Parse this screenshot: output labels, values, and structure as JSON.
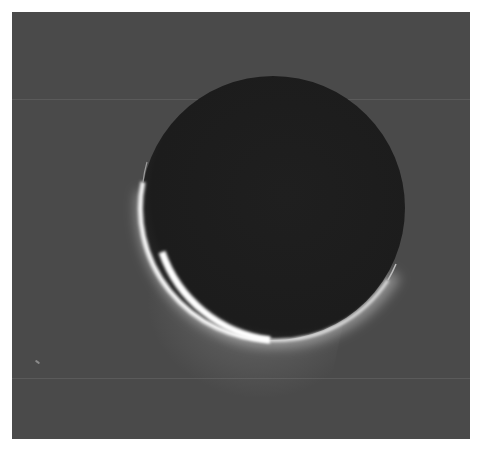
{
  "image": {
    "description": "Backlit crescent of an icy moon with a plume glow near its lower-left limb",
    "colors": {
      "background": "#4a4a4a",
      "disk": "#1e1e1e",
      "limb": "#f4f4f4",
      "plume": "#c8c8c8",
      "page": "#ffffff"
    },
    "disk": {
      "cx": 261,
      "cy": 196,
      "r": 132
    },
    "scanlines_y": [
      87,
      366
    ],
    "streak": {
      "x": 23,
      "y": 349
    }
  },
  "caption": {
    "text": ""
  }
}
